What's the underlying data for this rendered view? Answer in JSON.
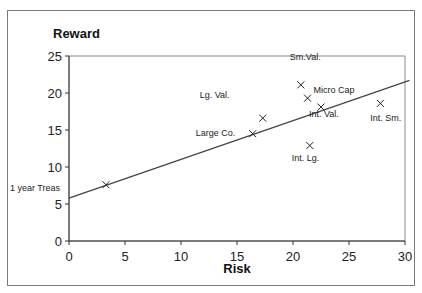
{
  "chart_data": {
    "type": "scatter",
    "title": "",
    "xlabel": "Risk",
    "ylabel": "Reward",
    "xlim": [
      0,
      30
    ],
    "ylim": [
      0,
      25
    ],
    "xticks": [
      0,
      5,
      10,
      15,
      20,
      25,
      30
    ],
    "yticks": [
      0,
      5,
      10,
      15,
      20,
      25
    ],
    "grid": false,
    "legend": null,
    "series": [
      {
        "name": "Asset classes",
        "marker": "x",
        "points": [
          {
            "label": "1 year Treas",
            "x": 3.3,
            "y": 7.6
          },
          {
            "label": "Large Co.",
            "x": 16.4,
            "y": 14.5
          },
          {
            "label": "Lg. Val.",
            "x": 17.3,
            "y": 16.6
          },
          {
            "label": "Sm.Val.",
            "x": 20.7,
            "y": 21.1
          },
          {
            "label": "Micro Cap",
            "x": 21.3,
            "y": 19.3
          },
          {
            "label": "Int. Val.",
            "x": 22.5,
            "y": 18.1
          },
          {
            "label": "Int. Lg.",
            "x": 21.5,
            "y": 12.9
          },
          {
            "label": "Int. Sm.",
            "x": 27.8,
            "y": 18.6
          }
        ]
      }
    ],
    "trendline": {
      "type": "linear",
      "x0": 0,
      "y0": 5.8,
      "x1": 30.4,
      "y1": 21.7
    }
  }
}
